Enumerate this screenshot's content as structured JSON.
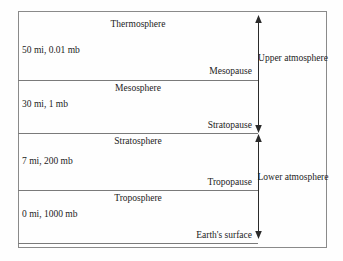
{
  "figure": {
    "title_present": false,
    "layers": [
      {
        "name": "thermosphere",
        "label": "Thermosphere"
      },
      {
        "name": "mesosphere",
        "label": "Mesosphere"
      },
      {
        "name": "stratosphere",
        "label": "Stratosphere"
      },
      {
        "name": "troposphere",
        "label": "Troposphere"
      }
    ],
    "boundaries": [
      {
        "name": "mesopause",
        "label": "Mesopause"
      },
      {
        "name": "stratopause",
        "label": "Stratopause"
      },
      {
        "name": "tropopause",
        "label": "Tropopause"
      },
      {
        "name": "earths-surface",
        "label": "Earth's surface"
      }
    ],
    "altitude_markers": [
      {
        "name": "marker-50mi",
        "label": "50 mi, 0.01 mb",
        "altitude_mi": 50,
        "pressure_mb": 0.01
      },
      {
        "name": "marker-30mi",
        "label": "30 mi, 1 mb",
        "altitude_mi": 30,
        "pressure_mb": 1
      },
      {
        "name": "marker-7mi",
        "label": "7 mi, 200 mb",
        "altitude_mi": 7,
        "pressure_mb": 200
      },
      {
        "name": "marker-0mi",
        "label": "0 mi, 1000 mb",
        "altitude_mi": 0,
        "pressure_mb": 1000
      }
    ],
    "regions": [
      {
        "name": "upper-atmosphere",
        "label": "Upper atmosphere"
      },
      {
        "name": "lower-atmosphere",
        "label": "Lower atmosphere"
      }
    ],
    "colors": {
      "line": "#7a7a7a",
      "frame": "#8a8a8a",
      "text": "#1c1c1c",
      "background": "#fefefe"
    }
  }
}
